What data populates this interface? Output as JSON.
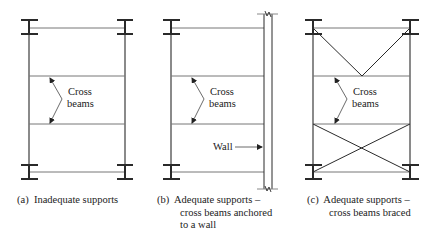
{
  "panels": [
    {
      "id": "a",
      "label": "Cross",
      "label2": "beams",
      "caption_tag": "(a)",
      "caption_lines": [
        "Inadequate supports"
      ]
    },
    {
      "id": "b",
      "label": "Cross",
      "label2": "beams",
      "wall_label": "Wall",
      "caption_tag": "(b)",
      "caption_lines": [
        "Adequate supports –",
        "cross beams anchored",
        "to a wall"
      ]
    },
    {
      "id": "c",
      "label": "Cross",
      "label2": "beams",
      "caption_tag": "(c)",
      "caption_lines": [
        "Adequate supports –",
        "cross beams braced"
      ]
    }
  ],
  "colors": {
    "line": "#2a2a2a",
    "thin_line": "#555555",
    "background": "#ffffff"
  }
}
